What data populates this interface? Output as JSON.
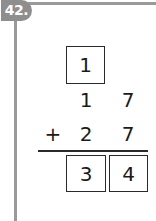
{
  "problem": {
    "number": "42.",
    "badge_color": "#8e8e8e",
    "carry_box": "1",
    "addend1": {
      "tens": "1",
      "ones": "7"
    },
    "operator": "+",
    "addend2": {
      "tens": "2",
      "ones": "7"
    },
    "answer": {
      "tens": "3",
      "ones": "4"
    }
  }
}
